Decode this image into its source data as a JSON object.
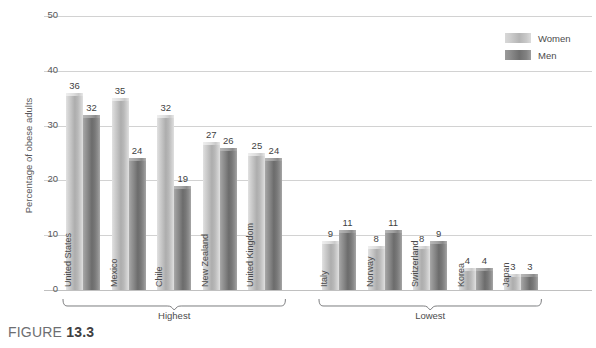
{
  "figure": {
    "caption_prefix": "FIGURE",
    "caption_number": "13.3"
  },
  "legend": {
    "entries": [
      {
        "label": "Women",
        "color": "#c3c3c3",
        "icon": "legend-swatch-icon"
      },
      {
        "label": "Men",
        "color": "#868686",
        "icon": "legend-swatch-icon"
      }
    ]
  },
  "axis": {
    "y_title": "Percentage of obese adults",
    "y_ticks": [
      "0",
      "10",
      "20",
      "30",
      "40",
      "50"
    ]
  },
  "groups": [
    {
      "name": "Highest",
      "label": "Highest"
    },
    {
      "name": "Lowest",
      "label": "Lowest"
    }
  ],
  "chart_data": {
    "type": "bar",
    "title": "",
    "subtitle": "",
    "xlabel": "",
    "ylabel": "Percentage of obese adults",
    "ylim": [
      0,
      50
    ],
    "yticks": [
      0,
      10,
      20,
      30,
      40,
      50
    ],
    "grid": true,
    "legend_position": "top-right",
    "categories": [
      "United States",
      "Mexico",
      "Chile",
      "New Zealand",
      "United Kingdom",
      "Italy",
      "Norway",
      "Switzerland",
      "Korea",
      "Japan"
    ],
    "category_groups": [
      {
        "label": "Highest",
        "categories": [
          "United States",
          "Mexico",
          "Chile",
          "New Zealand",
          "United Kingdom"
        ]
      },
      {
        "label": "Lowest",
        "categories": [
          "Italy",
          "Norway",
          "Switzerland",
          "Korea",
          "Japan"
        ]
      }
    ],
    "series": [
      {
        "name": "Women",
        "color": "#c3c3c3",
        "values": [
          36,
          35,
          32,
          27,
          25,
          9,
          8,
          8,
          4,
          3
        ]
      },
      {
        "name": "Men",
        "color": "#868686",
        "values": [
          32,
          24,
          19,
          26,
          24,
          11,
          11,
          9,
          4,
          3
        ]
      }
    ]
  }
}
